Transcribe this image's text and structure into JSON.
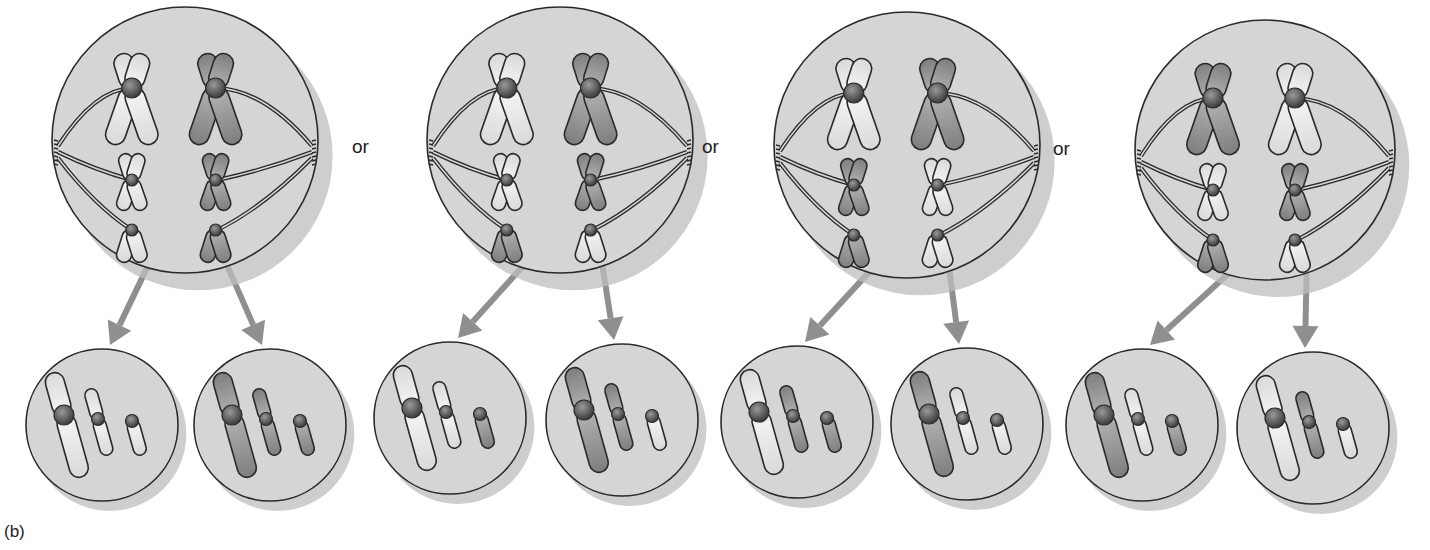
{
  "figure": {
    "panel_label": "(b)",
    "separator_label": "or",
    "colors": {
      "cell_fill": "#d6d6d6",
      "cell_shadow": "#bdbdbd",
      "outline": "#2a2a2a",
      "light_chromosome": "#efefef",
      "dark_chromosome": "#9a9a9a",
      "centromere": "#555555",
      "arrow": "#8f8f8f"
    },
    "scenarios": [
      {
        "id": "arrangement-1",
        "parent": {
          "cx": 185,
          "cy": 140,
          "r": 133,
          "left_column": [
            "light",
            "light",
            "light"
          ],
          "right_column": [
            "dark",
            "dark",
            "dark"
          ]
        },
        "daughters": [
          {
            "cx": 102,
            "cy": 425,
            "r": 76,
            "chromosomes": [
              "light",
              "light",
              "light"
            ]
          },
          {
            "cx": 270,
            "cy": 425,
            "r": 76,
            "chromosomes": [
              "dark",
              "dark",
              "dark"
            ]
          }
        ]
      },
      {
        "id": "arrangement-2",
        "parent": {
          "cx": 560,
          "cy": 140,
          "r": 133,
          "left_column": [
            "light",
            "light",
            "dark"
          ],
          "right_column": [
            "dark",
            "dark",
            "light"
          ]
        },
        "daughters": [
          {
            "cx": 450,
            "cy": 418,
            "r": 76,
            "chromosomes": [
              "light",
              "light",
              "dark"
            ]
          },
          {
            "cx": 622,
            "cy": 420,
            "r": 76,
            "chromosomes": [
              "dark",
              "dark",
              "light"
            ]
          }
        ]
      },
      {
        "id": "arrangement-3",
        "parent": {
          "cx": 907,
          "cy": 145,
          "r": 133,
          "left_column": [
            "light",
            "dark",
            "dark"
          ],
          "right_column": [
            "dark",
            "light",
            "light"
          ]
        },
        "daughters": [
          {
            "cx": 797,
            "cy": 422,
            "r": 76,
            "chromosomes": [
              "light",
              "dark",
              "dark"
            ]
          },
          {
            "cx": 967,
            "cy": 424,
            "r": 76,
            "chromosomes": [
              "dark",
              "light",
              "light"
            ]
          }
        ]
      },
      {
        "id": "arrangement-4",
        "parent": {
          "cx": 1265,
          "cy": 150,
          "r": 130,
          "left_column": [
            "dark",
            "light",
            "dark"
          ],
          "right_column": [
            "light",
            "dark",
            "light"
          ]
        },
        "daughters": [
          {
            "cx": 1142,
            "cy": 425,
            "r": 76,
            "chromosomes": [
              "dark",
              "light",
              "dark"
            ]
          },
          {
            "cx": 1313,
            "cy": 428,
            "r": 76,
            "chromosomes": [
              "light",
              "dark",
              "light"
            ]
          }
        ]
      }
    ],
    "or_positions": [
      {
        "x": 352,
        "y": 136
      },
      {
        "x": 702,
        "y": 136
      },
      {
        "x": 1053,
        "y": 138
      }
    ]
  }
}
